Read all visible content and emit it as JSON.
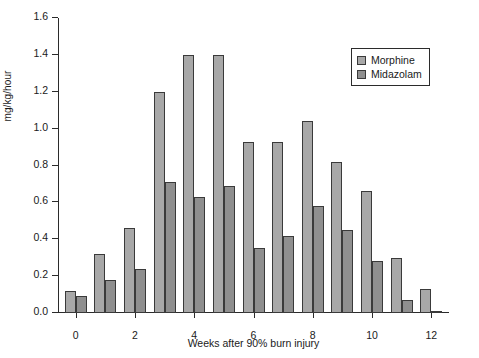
{
  "chart_data": {
    "type": "bar",
    "title": "",
    "xlabel": "Weeks after 90% burn injury",
    "ylabel": "mg/kg/hour",
    "categories": [
      0,
      1,
      2,
      3,
      4,
      5,
      6,
      7,
      8,
      9,
      10,
      11,
      12
    ],
    "xtick_labels": [
      "0",
      "2",
      "4",
      "6",
      "8",
      "10",
      "12"
    ],
    "xtick_values": [
      0,
      2,
      4,
      6,
      8,
      10,
      12
    ],
    "ytick_labels": [
      "0.0",
      "0.2",
      "0.4",
      "0.6",
      "0.8",
      "1.0",
      "1.2",
      "1.4",
      "1.6"
    ],
    "ytick_values": [
      0.0,
      0.2,
      0.4,
      0.6,
      0.8,
      1.0,
      1.2,
      1.4,
      1.6
    ],
    "ylim": [
      0.0,
      1.6
    ],
    "xlim": [
      -0.6,
      12.6
    ],
    "grid": false,
    "legend_position": "top-right",
    "series": [
      {
        "name": "Morphine",
        "color": "#a8a8a8",
        "values": [
          0.12,
          0.32,
          0.46,
          1.2,
          1.4,
          1.4,
          0.93,
          0.93,
          1.04,
          0.82,
          0.66,
          0.3,
          0.13
        ]
      },
      {
        "name": "Midazolam",
        "color": "#8f8f8f",
        "values": [
          0.09,
          0.18,
          0.24,
          0.71,
          0.63,
          0.69,
          0.35,
          0.42,
          0.58,
          0.45,
          0.28,
          0.07,
          0.01
        ]
      }
    ]
  },
  "legend": {
    "items": [
      {
        "label": "Morphine"
      },
      {
        "label": "Midazolam"
      }
    ]
  }
}
